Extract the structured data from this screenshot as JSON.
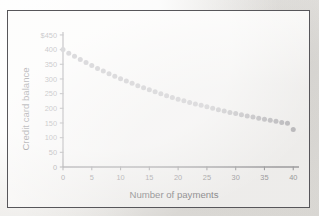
{
  "figure": {
    "background_color": "#fbfaf9",
    "frame_color": "#57565a",
    "axis_color": "#8f8e92",
    "point_color": "#b0afb4"
  },
  "chart_data": {
    "type": "scatter",
    "title": "",
    "xlabel": "Number of payments",
    "ylabel": "Credit card balance",
    "xlim": [
      0,
      41
    ],
    "ylim": [
      0,
      460
    ],
    "grid": false,
    "legend": null,
    "xticks": [
      0,
      5,
      10,
      15,
      20,
      25,
      30,
      35,
      40
    ],
    "xtick_labels": [
      "0",
      "5",
      "10",
      "15",
      "20",
      "25",
      "30",
      "35",
      "40"
    ],
    "yticks": [
      0,
      50,
      100,
      150,
      200,
      250,
      300,
      350,
      400,
      450
    ],
    "ytick_labels": [
      "0",
      "50",
      "100",
      "150",
      "200",
      "250",
      "300",
      "350",
      "400",
      "$450"
    ],
    "series": [
      {
        "name": "Credit card balance",
        "marker": "circle",
        "color": "#b0afb4",
        "x": [
          0,
          1,
          2,
          3,
          4,
          5,
          6,
          7,
          8,
          9,
          10,
          11,
          12,
          13,
          14,
          15,
          16,
          17,
          18,
          19,
          20,
          21,
          22,
          23,
          24,
          25,
          26,
          27,
          28,
          29,
          30,
          31,
          32,
          33,
          34,
          35,
          36,
          37,
          38,
          39,
          40
        ],
        "y": [
          400,
          388,
          377,
          366,
          356,
          346,
          336,
          327,
          318,
          309,
          301,
          293,
          285,
          277,
          270,
          263,
          256,
          250,
          243,
          237,
          231,
          226,
          220,
          215,
          210,
          205,
          200,
          195,
          191,
          186,
          182,
          178,
          174,
          170,
          166,
          163,
          159,
          156,
          152,
          149,
          128
        ]
      }
    ]
  }
}
